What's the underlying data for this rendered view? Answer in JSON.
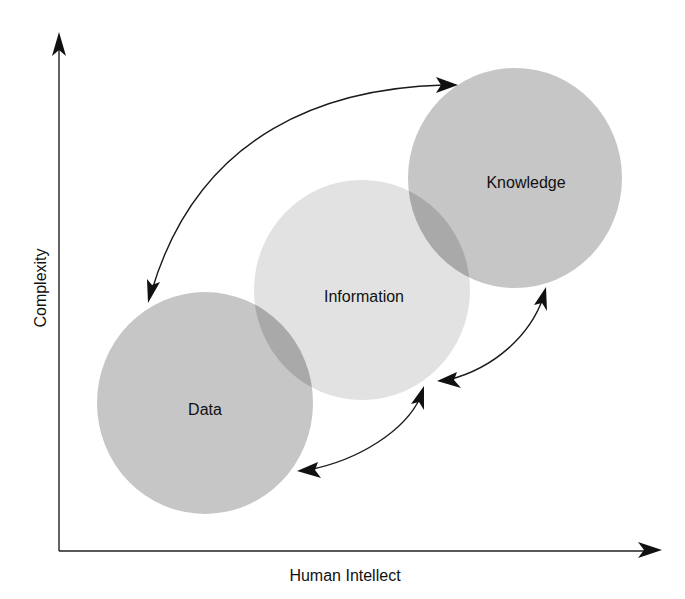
{
  "diagram": {
    "title": "",
    "axes": {
      "x_label": "Human Intellect",
      "y_label": "Complexity"
    },
    "nodes": [
      {
        "id": "data",
        "label": "Data",
        "fill": "#c6c6c6"
      },
      {
        "id": "information",
        "label": "Information",
        "fill": "#e2e2e2"
      },
      {
        "id": "knowledge",
        "label": "Knowledge",
        "fill": "#c6c6c6"
      }
    ],
    "connections": [
      {
        "from": "knowledge",
        "to": "data",
        "type": "bidirectional",
        "style": "large arc over top"
      },
      {
        "from": "data",
        "to": "information",
        "type": "bidirectional"
      },
      {
        "from": "information",
        "to": "knowledge",
        "type": "bidirectional"
      }
    ],
    "colors": {
      "background": "#ffffff",
      "lines": "#1a1a1a",
      "overlap": "#a9a9a9"
    }
  }
}
